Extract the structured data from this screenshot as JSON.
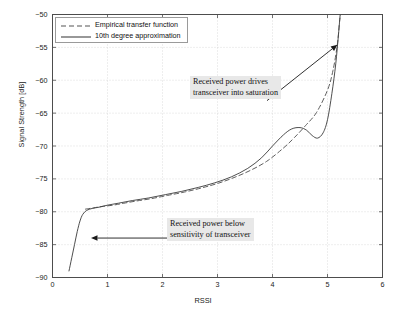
{
  "chart_data": {
    "type": "line",
    "title": "",
    "xlabel": "RSSI",
    "ylabel": "Signal Strength [dB]",
    "xlim": [
      0,
      6
    ],
    "ylim": [
      -90,
      -50
    ],
    "xticks": [
      "0",
      "1",
      "2",
      "3",
      "4",
      "5",
      "6"
    ],
    "yticks": [
      "-90",
      "-85",
      "-80",
      "-75",
      "-70",
      "-65",
      "-60",
      "-55",
      "-50"
    ],
    "grid": true,
    "legend_position": "top-left",
    "series": [
      {
        "name": "Empirical transfer function",
        "style": "dashed",
        "color": "#555555",
        "points": [
          [
            0.6,
            -79.6
          ],
          [
            0.75,
            -79.4
          ],
          [
            0.9,
            -79.2
          ],
          [
            1.1,
            -79.0
          ],
          [
            1.3,
            -78.7
          ],
          [
            1.5,
            -78.4
          ],
          [
            1.8,
            -78.0
          ],
          [
            2.1,
            -77.5
          ],
          [
            2.4,
            -77.0
          ],
          [
            2.7,
            -76.4
          ],
          [
            3.0,
            -75.7
          ],
          [
            3.3,
            -74.8
          ],
          [
            3.6,
            -73.7
          ],
          [
            3.9,
            -72.3
          ],
          [
            4.2,
            -70.3
          ],
          [
            4.4,
            -68.7
          ],
          [
            4.6,
            -66.9
          ],
          [
            4.8,
            -64.9
          ],
          [
            5.0,
            -61.5
          ],
          [
            5.1,
            -58.5
          ],
          [
            5.18,
            -54.5
          ],
          [
            5.22,
            -51.0
          ],
          [
            5.24,
            -50.0
          ]
        ]
      },
      {
        "name": "10th degree approximation",
        "style": "solid",
        "color": "#444444",
        "points": [
          [
            0.3,
            -89.0
          ],
          [
            0.35,
            -87.0
          ],
          [
            0.4,
            -85.0
          ],
          [
            0.45,
            -83.0
          ],
          [
            0.5,
            -81.4
          ],
          [
            0.55,
            -80.4
          ],
          [
            0.62,
            -79.8
          ],
          [
            0.72,
            -79.5
          ],
          [
            0.85,
            -79.3
          ],
          [
            1.0,
            -79.0
          ],
          [
            1.2,
            -78.7
          ],
          [
            1.45,
            -78.3
          ],
          [
            1.75,
            -77.9
          ],
          [
            2.05,
            -77.4
          ],
          [
            2.35,
            -76.9
          ],
          [
            2.65,
            -76.3
          ],
          [
            2.95,
            -75.6
          ],
          [
            3.25,
            -74.7
          ],
          [
            3.55,
            -73.4
          ],
          [
            3.8,
            -71.8
          ],
          [
            4.0,
            -70.0
          ],
          [
            4.2,
            -68.3
          ],
          [
            4.35,
            -67.4
          ],
          [
            4.5,
            -67.2
          ],
          [
            4.62,
            -67.6
          ],
          [
            4.72,
            -68.4
          ],
          [
            4.82,
            -68.8
          ],
          [
            4.92,
            -68.0
          ],
          [
            5.0,
            -66.0
          ],
          [
            5.08,
            -62.0
          ],
          [
            5.15,
            -57.5
          ],
          [
            5.2,
            -53.0
          ],
          [
            5.23,
            -50.0
          ]
        ]
      }
    ],
    "annotations": [
      {
        "id": "saturation",
        "lines": [
          "Received power drives",
          "transceiver into saturation"
        ],
        "arrow_from": [
          3.9,
          -63.1
        ],
        "arrow_to": [
          5.18,
          -54.6
        ]
      },
      {
        "id": "sensitivity",
        "lines": [
          "Received power below",
          "sensitivity of transceiver"
        ],
        "arrow_from": [
          3.22,
          -84.0
        ],
        "arrow_to": [
          0.7,
          -84.0
        ]
      }
    ]
  },
  "legend": {
    "items": [
      {
        "label": "Empirical transfer function",
        "style": "dashed"
      },
      {
        "label": "10th degree approximation",
        "style": "solid"
      }
    ]
  },
  "axis": {
    "xlabel": "RSSI",
    "ylabel": "Signal Strength [dB]"
  },
  "annotations": {
    "saturation_line1": "Received power drives",
    "saturation_line2": "transceiver into saturation",
    "sensitivity_line1": "Received power below",
    "sensitivity_line2": "sensitivity of transceiver"
  },
  "colors": {
    "axis": "#4d4d4d",
    "grid": "#c8c8c8",
    "empirical": "#555555",
    "approximation": "#444444",
    "annotation_bg": "#e8e8e8",
    "background": "#ffffff"
  }
}
